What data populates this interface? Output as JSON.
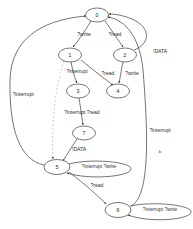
{
  "diagram": {
    "type": "state-machine-graph",
    "width": 193,
    "height": 229,
    "background_color": "#ffffff",
    "node_stroke_color": "#3a3a3a",
    "edge_stroke_color": "#3a3a3a",
    "dashed_edge_color": "#b6b6b6",
    "nodes": [
      {
        "id": "0",
        "label": "0",
        "cx": 97,
        "cy": 15,
        "rx": 11.5,
        "ry": 7.0
      },
      {
        "id": "1",
        "label": "1",
        "cx": 70,
        "cy": 55,
        "rx": 11.5,
        "ry": 7.0
      },
      {
        "id": "2",
        "label": "2",
        "cx": 125,
        "cy": 55,
        "rx": 11.5,
        "ry": 7.0
      },
      {
        "id": "3",
        "label": "3",
        "cx": 78,
        "cy": 91,
        "rx": 11.5,
        "ry": 7.0
      },
      {
        "id": "4",
        "label": "4",
        "cx": 118,
        "cy": 91,
        "rx": 11.5,
        "ry": 7.0
      },
      {
        "id": "7",
        "label": "7",
        "cx": 84,
        "cy": 133,
        "rx": 11.5,
        "ry": 7.0
      },
      {
        "id": "5",
        "label": "5",
        "cx": 57,
        "cy": 167,
        "rx": 13.0,
        "ry": 7.5
      },
      {
        "id": "6",
        "label": "6",
        "cx": 118,
        "cy": 210,
        "rx": 13.0,
        "ry": 7.5
      }
    ],
    "edges": [
      {
        "id": "e-0-1",
        "from": "0",
        "to": "1",
        "label": "?write",
        "label_x": 84,
        "label_y": 35
      },
      {
        "id": "e-0-2",
        "from": "0",
        "to": "2",
        "label": "?read",
        "label_x": 115,
        "label_y": 35
      },
      {
        "id": "e-1-3",
        "from": "1",
        "to": "3",
        "label": "?interrupt",
        "label_x": 77,
        "label_y": 72
      },
      {
        "id": "e-1-4",
        "from": "1",
        "to": "4",
        "label": "?read",
        "label_x": 108,
        "label_y": 74
      },
      {
        "id": "e-2-4",
        "from": "2",
        "to": "4",
        "label": "?write",
        "label_x": 132,
        "label_y": 74
      },
      {
        "id": "e-2-0",
        "from": "2",
        "to": "0",
        "label": "!DATA",
        "label_x": 160,
        "label_y": 52
      },
      {
        "id": "e-3-7",
        "from": "3",
        "to": "7",
        "label": "?interrupt ?read",
        "label_x": 82,
        "label_y": 113
      },
      {
        "id": "e-7-5",
        "from": "7",
        "to": "5",
        "label": "!DATA",
        "label_x": 79,
        "label_y": 150
      },
      {
        "id": "e-1-5",
        "from": "1",
        "to": "5",
        "label": "",
        "label_x": 0,
        "label_y": 0,
        "dashed": true
      },
      {
        "id": "e-5-6",
        "from": "5",
        "to": "6",
        "label": "?read",
        "label_x": 97,
        "label_y": 186
      },
      {
        "id": "e-5-0",
        "from": "5",
        "to": "0",
        "label": "?interrupt",
        "label_x": 23,
        "label_y": 95
      },
      {
        "id": "e-6-0",
        "from": "6",
        "to": "0",
        "label": "?interrupt",
        "label_x": 160,
        "label_y": 131
      }
    ],
    "self_loops": [
      {
        "id": "loop-5",
        "node": "5",
        "label": "?interrupt ?write",
        "label_x": 99,
        "label_y": 167
      },
      {
        "id": "loop-6",
        "node": "6",
        "label": "?interrupt ?write",
        "label_x": 160,
        "label_y": 210
      }
    ],
    "annotations": [
      {
        "id": "marker-b",
        "text": "b",
        "x": 160,
        "y": 152
      }
    ]
  }
}
